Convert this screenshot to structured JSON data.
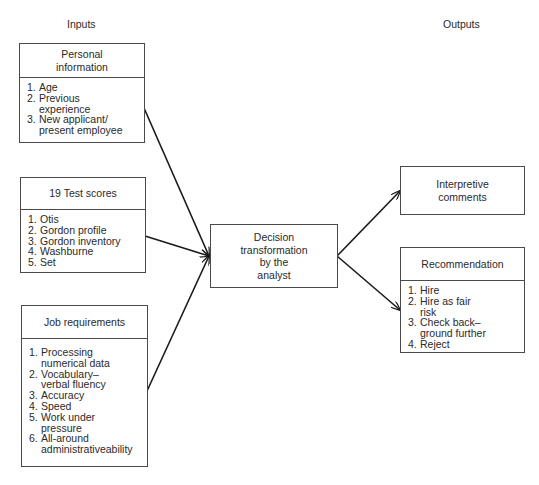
{
  "column_labels": {
    "inputs": "Inputs",
    "outputs": "Outputs"
  },
  "inputs": [
    {
      "title": "Personal\ninformation",
      "items": [
        {
          "n": "1.",
          "text": "Age"
        },
        {
          "n": "2.",
          "text": "Previous\n  experience"
        },
        {
          "n": "3.",
          "text": "New applicant/\npresent employee"
        }
      ]
    },
    {
      "title": "19 Test scores",
      "items": [
        {
          "n": "1.",
          "text": "Otis"
        },
        {
          "n": "2.",
          "text": "Gordon profile"
        },
        {
          "n": "3.",
          "text": "Gordon inventory"
        },
        {
          "n": "4.",
          "text": "Washburne"
        },
        {
          "n": "5.",
          "text": "Set"
        }
      ]
    },
    {
      "title": "Job requirements",
      "items": [
        {
          "n": "1.",
          "text": "Processing\nnumerical data"
        },
        {
          "n": "2.",
          "text": "Vocabulary–\nverbal fluency"
        },
        {
          "n": "3.",
          "text": "Accuracy"
        },
        {
          "n": "4.",
          "text": "Speed"
        },
        {
          "n": "5.",
          "text": "Work under\npressure"
        },
        {
          "n": "6.",
          "text": "All-around\nadministrativeability"
        }
      ]
    }
  ],
  "process": {
    "title": "Decision\ntransformation\nby the\nanalyst"
  },
  "outputs": [
    {
      "title": "Interpretive\ncomments"
    },
    {
      "title": "Recommendation",
      "items": [
        {
          "n": "1.",
          "text": "Hire"
        },
        {
          "n": "2.",
          "text": "Hire as fair\nrisk"
        },
        {
          "n": "3.",
          "text": "Check back–\nground further"
        },
        {
          "n": "4.",
          "text": "Reject"
        }
      ]
    }
  ],
  "colors": {
    "line": "#1a1a1a",
    "border": "#4a4a4a",
    "text": "#2a2a2a"
  }
}
